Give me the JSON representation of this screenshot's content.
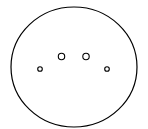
{
  "diagram": {
    "background": "#ffffff",
    "stroke_color": "#000000",
    "outer_shape": {
      "type": "ellipse",
      "cx": 74,
      "cy": 67,
      "rx": 63,
      "ry": 60,
      "stroke_width": 1.2
    },
    "inner_dots": [
      {
        "cx": 40,
        "cy": 69,
        "r": 2.3
      },
      {
        "cx": 61.5,
        "cy": 56.5,
        "r": 3.2
      },
      {
        "cx": 86,
        "cy": 56.5,
        "r": 3.2
      },
      {
        "cx": 107,
        "cy": 69,
        "r": 2.3
      }
    ]
  }
}
